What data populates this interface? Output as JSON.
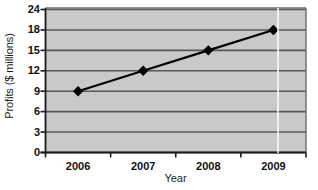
{
  "chart_data": {
    "type": "line",
    "title": "",
    "xlabel": "Year",
    "ylabel": "Profits ($ millions)",
    "categories": [
      "2006",
      "2007",
      "2008",
      "2009"
    ],
    "values": [
      9,
      12,
      15,
      18
    ],
    "series": [
      {
        "name": "Profits",
        "values": [
          9,
          12,
          15,
          18
        ],
        "marker": "diamond",
        "marker_color": "#000000",
        "line_color": "#000000"
      }
    ],
    "x": [
      2006,
      2007,
      2008,
      2009
    ],
    "ylim": [
      0,
      24
    ],
    "ytick_labels": [
      "0",
      "3",
      "6",
      "9",
      "12",
      "15",
      "18",
      "24"
    ],
    "xtick_labels": [
      "2006",
      "2007",
      "2008",
      "2009"
    ],
    "grid": "horizontal",
    "legend": "none",
    "plot_background_color": "#c9c9c9",
    "gridline_color": "#595959",
    "axis_color": "#1b1b1b",
    "figure_background_color": "#ffffff"
  },
  "axes": {
    "y_title": "Profits ($ millions)",
    "x_title": "Year"
  }
}
